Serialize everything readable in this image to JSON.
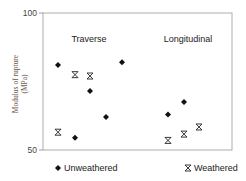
{
  "chart_data": {
    "type": "scatter",
    "title": "",
    "xlabel": "",
    "ylabel": "Modulus of rupture (MPa)",
    "ylabel_lines": [
      "Modulus of rupture",
      "(MPa)"
    ],
    "ylim": [
      50,
      100
    ],
    "yticks": [
      50,
      100
    ],
    "grid": false,
    "legend_position": "bottom",
    "group_labels": [
      "Traverse",
      "Longitudinal"
    ],
    "series": [
      {
        "name": "Unweathered",
        "marker": "diamond",
        "points": [
          {
            "group": "Traverse",
            "x_index": 1,
            "y": 81
          },
          {
            "group": "Traverse",
            "x_index": 2,
            "y": 54.5
          },
          {
            "group": "Traverse",
            "x_index": 3,
            "y": 71.5
          },
          {
            "group": "Traverse",
            "x_index": 4,
            "y": 62
          },
          {
            "group": "Traverse",
            "x_index": 5,
            "y": 82
          },
          {
            "group": "Longitudinal",
            "x_index": 8,
            "y": 63
          },
          {
            "group": "Longitudinal",
            "x_index": 9,
            "y": 67.5
          }
        ]
      },
      {
        "name": "Weathered",
        "marker": "x-bar",
        "points": [
          {
            "group": "Traverse",
            "x_index": 1,
            "y": 56.5
          },
          {
            "group": "Traverse",
            "x_index": 2,
            "y": 77.5
          },
          {
            "group": "Traverse",
            "x_index": 3,
            "y": 77
          },
          {
            "group": "Longitudinal",
            "x_index": 8,
            "y": 53.5
          },
          {
            "group": "Longitudinal",
            "x_index": 9,
            "y": 55.8
          },
          {
            "group": "Longitudinal",
            "x_index": 10,
            "y": 58.4
          }
        ]
      }
    ]
  },
  "axis": {
    "y_top_label": "100",
    "y_bottom_label": "50"
  },
  "labels": {
    "traverse": "Traverse",
    "longitudinal": "Longitudinal"
  },
  "legend": {
    "unweathered": "Unweathered",
    "weathered": "Weathered"
  },
  "colors": {
    "marker": "#111111",
    "axis": "#888888",
    "ylabel": "#6b5a4e"
  }
}
